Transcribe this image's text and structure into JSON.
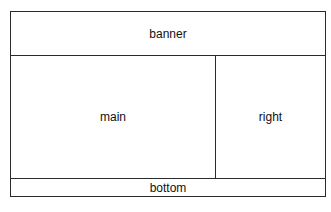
{
  "diagram": {
    "type": "page-layout",
    "regions": {
      "banner": {
        "label": "banner"
      },
      "main": {
        "label": "main"
      },
      "right": {
        "label": "right"
      },
      "bottom": {
        "label": "bottom"
      }
    },
    "colors": {
      "border": "#2a2a2a",
      "background": "#ffffff",
      "text": "#111111"
    }
  }
}
